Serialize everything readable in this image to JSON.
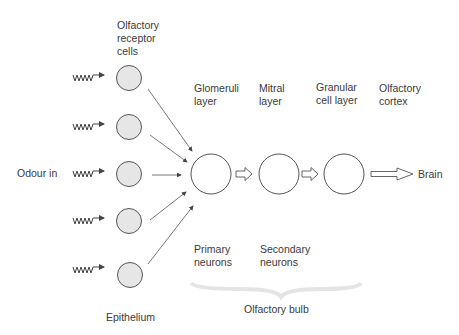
{
  "labels": {
    "receptor_cells": [
      "Olfactory",
      "receptor",
      "cells"
    ],
    "odour_in": "Odour in",
    "epithelium": "Epithelium",
    "glomeruli": [
      "Glomeruli",
      "layer"
    ],
    "mitral": [
      "Mitral",
      "layer"
    ],
    "granular": [
      "Granular",
      "cell layer"
    ],
    "cortex": [
      "Olfactory",
      "cortex"
    ],
    "primary": [
      "Primary",
      "neurons"
    ],
    "secondary": [
      "Secondary",
      "neurons"
    ],
    "bulb": "Olfactory bulb",
    "brain": "Brain"
  },
  "colors": {
    "receptor_fill": "#e6e6e6",
    "stroke": "#555555",
    "text": "#3a3a3a"
  }
}
